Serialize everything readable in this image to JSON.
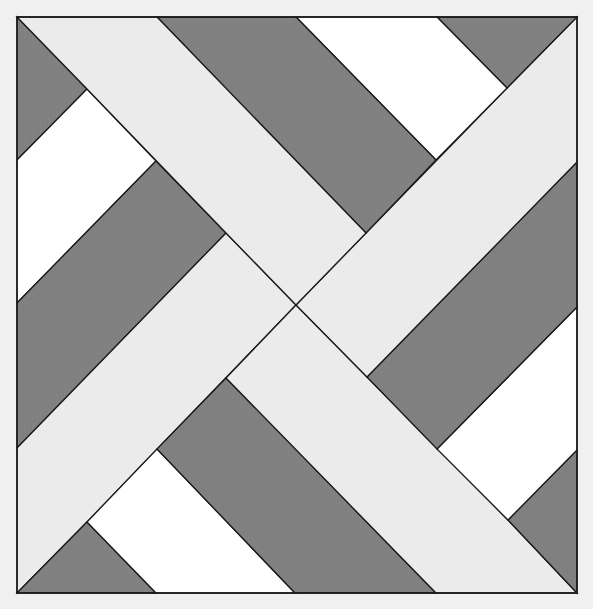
{
  "diagram": {
    "title": "",
    "canvas": {
      "width": 593,
      "height": 609
    },
    "colors": {
      "background": "#f0f0f0",
      "dark": "#7e7e7e",
      "light": "#ebebeb",
      "white": "#ffffff",
      "stroke": "#1a1a1a"
    },
    "frame": {
      "x": 17,
      "y": 17,
      "width": 560,
      "height": 576
    },
    "pieces": [
      {
        "name": "dark-triangle-top-left",
        "fill": "dark",
        "points": [
          [
            17,
            17
          ],
          [
            87,
            89
          ],
          [
            17,
            160
          ]
        ]
      },
      {
        "name": "white-strip-top-left",
        "fill": "white",
        "points": [
          [
            87,
            89
          ],
          [
            156,
            161
          ],
          [
            17,
            303
          ],
          [
            17,
            160
          ]
        ]
      },
      {
        "name": "dark-strip-left",
        "fill": "dark",
        "points": [
          [
            156,
            161
          ],
          [
            226,
            233
          ],
          [
            17,
            448
          ],
          [
            17,
            303
          ]
        ]
      },
      {
        "name": "light-band-lower-left",
        "fill": "light",
        "points": [
          [
            226,
            233
          ],
          [
            296,
            305
          ],
          [
            87,
            522
          ],
          [
            17,
            593
          ],
          [
            17,
            448
          ]
        ]
      },
      {
        "name": "dark-triangle-bottom-left",
        "fill": "dark",
        "points": [
          [
            87,
            522
          ],
          [
            156,
            593
          ],
          [
            17,
            593
          ]
        ]
      },
      {
        "name": "white-strip-bottom-left",
        "fill": "white",
        "points": [
          [
            157,
            449
          ],
          [
            295,
            593
          ],
          [
            156,
            593
          ],
          [
            87,
            522
          ]
        ]
      },
      {
        "name": "dark-strip-bottom",
        "fill": "dark",
        "points": [
          [
            226,
            378
          ],
          [
            436,
            593
          ],
          [
            295,
            593
          ],
          [
            157,
            449
          ]
        ]
      },
      {
        "name": "light-band-lower-right",
        "fill": "light",
        "points": [
          [
            296,
            305
          ],
          [
            508,
            520
          ],
          [
            577,
            593
          ],
          [
            436,
            593
          ],
          [
            226,
            378
          ]
        ]
      },
      {
        "name": "dark-triangle-bottom-right",
        "fill": "dark",
        "points": [
          [
            508,
            520
          ],
          [
            577,
            450
          ],
          [
            577,
            593
          ]
        ]
      },
      {
        "name": "white-strip-bottom-right",
        "fill": "white",
        "points": [
          [
            437,
            449
          ],
          [
            577,
            307
          ],
          [
            577,
            450
          ],
          [
            508,
            520
          ]
        ]
      },
      {
        "name": "dark-strip-right",
        "fill": "dark",
        "points": [
          [
            367,
            377
          ],
          [
            577,
            162
          ],
          [
            577,
            307
          ],
          [
            437,
            449
          ]
        ]
      },
      {
        "name": "light-band-upper-right",
        "fill": "light",
        "points": [
          [
            296,
            305
          ],
          [
            507,
            88
          ],
          [
            577,
            17
          ],
          [
            577,
            162
          ],
          [
            367,
            377
          ]
        ]
      },
      {
        "name": "dark-triangle-top-right",
        "fill": "dark",
        "points": [
          [
            437,
            17
          ],
          [
            577,
            17
          ],
          [
            507,
            88
          ]
        ]
      },
      {
        "name": "white-strip-top-right",
        "fill": "white",
        "points": [
          [
            296,
            17
          ],
          [
            437,
            17
          ],
          [
            507,
            88
          ],
          [
            436,
            160
          ]
        ]
      },
      {
        "name": "dark-strip-top",
        "fill": "dark",
        "points": [
          [
            157,
            17
          ],
          [
            296,
            17
          ],
          [
            436,
            160
          ],
          [
            366,
            233
          ]
        ]
      },
      {
        "name": "light-band-upper-left",
        "fill": "light",
        "points": [
          [
            17,
            17
          ],
          [
            157,
            17
          ],
          [
            366,
            233
          ],
          [
            296,
            305
          ],
          [
            226,
            233
          ],
          [
            87,
            89
          ]
        ]
      }
    ]
  }
}
